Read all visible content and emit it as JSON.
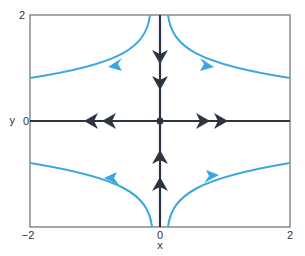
{
  "diagram": {
    "type": "phase_portrait",
    "title": "",
    "axes": {
      "xlabel": "x",
      "ylabel": "y",
      "xlim": [
        -2,
        2
      ],
      "ylim": [
        -2,
        2
      ],
      "x_ticks": [
        "−2",
        "0",
        "2"
      ],
      "y_ticks": [
        "2",
        "0"
      ],
      "y_tick_top": "2",
      "y_tick_zero": "0",
      "x_tick_left": "−2",
      "x_tick_mid": "0",
      "x_tick_right": "2"
    },
    "colors": {
      "frame": "#8a8a8a",
      "axis_trajectories": "#2c3440",
      "curved_trajectories": "#3aa8df"
    },
    "fixed_point": {
      "x": 0,
      "y": 0,
      "label": "saddle point"
    },
    "straight_trajectories": [
      {
        "name": "negative-x-axis",
        "direction": "away from origin (left)"
      },
      {
        "name": "positive-x-axis",
        "direction": "away from origin (right)"
      },
      {
        "name": "positive-y-axis",
        "direction": "toward origin (down)"
      },
      {
        "name": "negative-y-axis",
        "direction": "toward origin (up)"
      }
    ],
    "curved_trajectories": [
      {
        "quadrant": "upper-left",
        "direction": "from top toward left"
      },
      {
        "quadrant": "upper-right",
        "direction": "from top toward right"
      },
      {
        "quadrant": "lower-left",
        "direction": "from bottom toward left"
      },
      {
        "quadrant": "lower-right",
        "direction": "from bottom toward right"
      }
    ]
  }
}
